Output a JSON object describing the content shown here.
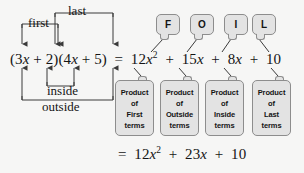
{
  "diagram": {
    "colors": {
      "background": "#f6f6f5",
      "ink": "#141414",
      "box_fill": "#e3e3e3",
      "box_border": "#8d8d8d",
      "arrow": "#3a3a3a"
    },
    "equation_main": {
      "left_factor_1": "(3x + 2)",
      "left_factor_2": "(4x + 5)",
      "equals": "=",
      "expansion_terms": [
        "12x",
        "15x",
        "8x",
        "10"
      ],
      "expansion_exponents": [
        "2",
        "",
        "",
        ""
      ],
      "plain": "(3x + 2)(4x + 5) = 12x² + 15x + 8x + 10"
    },
    "equation_final": {
      "equals": "=",
      "terms": [
        "12x",
        "23x",
        "10"
      ],
      "exponents": [
        "2",
        "",
        ""
      ],
      "plain": "= 12x² + 23x + 10"
    },
    "pair_labels": [
      {
        "id": "first",
        "text": "first"
      },
      {
        "id": "last",
        "text": "last"
      },
      {
        "id": "inside",
        "text": "inside"
      },
      {
        "id": "outside",
        "text": "outside"
      }
    ],
    "foil_chips": [
      {
        "letter": "F"
      },
      {
        "letter": "O"
      },
      {
        "letter": "I"
      },
      {
        "letter": "L"
      }
    ],
    "product_boxes": [
      {
        "lines": [
          "Product",
          "of",
          "First",
          "terms"
        ]
      },
      {
        "lines": [
          "Product",
          "of",
          "Outside",
          "terms"
        ]
      },
      {
        "lines": [
          "Product",
          "of",
          "Inside",
          "terms"
        ]
      },
      {
        "lines": [
          "Product",
          "of",
          "Last",
          "terms"
        ]
      }
    ]
  }
}
